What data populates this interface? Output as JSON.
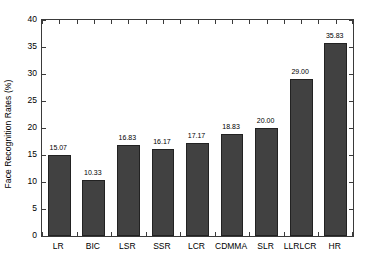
{
  "chart_data": {
    "type": "bar",
    "title": "",
    "xlabel": "",
    "ylabel": "Face Recognition Rates (%)",
    "categories": [
      "LR",
      "BIC",
      "LSR",
      "SSR",
      "LCR",
      "CDMMA",
      "SLR",
      "LLRLCR",
      "HR"
    ],
    "values": [
      15.07,
      10.33,
      16.83,
      16.17,
      17.17,
      18.83,
      20.0,
      29.0,
      35.83
    ],
    "value_labels": [
      "15.07",
      "10.33",
      "16.83",
      "16.17",
      "17.17",
      "18.83",
      "20.00",
      "29.00",
      "35.83"
    ],
    "ylim": [
      0,
      40
    ],
    "yticks": [
      0,
      5,
      10,
      15,
      20,
      25,
      30,
      35,
      40
    ],
    "ytick_labels": [
      "0",
      "5",
      "10",
      "15",
      "20",
      "25",
      "30",
      "35",
      "40"
    ],
    "grid": false,
    "legend": null,
    "bar_color": "#414141",
    "bar_edge_color": "#222222",
    "axis_color": "#3a3a3a",
    "background_color": "#ffffff"
  }
}
